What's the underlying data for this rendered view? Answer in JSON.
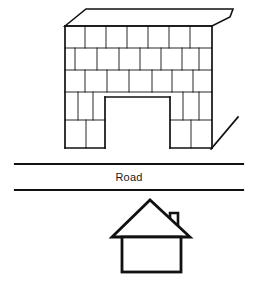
{
  "diagram": {
    "labels": {
      "road": "Road"
    },
    "colors": {
      "stroke": "#111111",
      "background": "#ffffff",
      "text": "#1a1a1a"
    },
    "elements": {
      "retaining_wall": {
        "name": "brick retaining wall with arch opening",
        "wall_left_x": 65,
        "wall_right_x": 212,
        "wall_top_y": 26,
        "wall_bottom_y": 148,
        "course_lines_y": [
          26,
          48,
          70,
          92,
          120,
          148
        ],
        "opening": {
          "left_x": 105,
          "right_x": 170,
          "top_y": 97,
          "bottom_y": 148
        },
        "roof_slab": {
          "front_left": [
            65,
            26
          ],
          "front_right": [
            212,
            26
          ],
          "back_left": [
            86,
            9
          ],
          "back_right": [
            233,
            9
          ],
          "right_corner_drop": [
            230,
            17
          ]
        },
        "courses": 5,
        "joint_pattern": "staggered running bond"
      },
      "diagonal_marker": {
        "name": "slope indicator line",
        "x1": 211,
        "y1": 149,
        "x2": 238,
        "y2": 117
      },
      "road_band": {
        "name": "road between two lines",
        "left_x": 15,
        "right_x": 243,
        "top_line_y": 164,
        "bottom_line_y": 190,
        "label_x": 129,
        "label_y": 177
      },
      "house": {
        "name": "small house below road",
        "roof_apex": [
          150,
          200
        ],
        "roof_left_eave": [
          112,
          237
        ],
        "roof_right_eave": [
          190,
          237
        ],
        "body_left_x": 122,
        "body_right_x": 181,
        "body_top_y": 237,
        "body_bottom_y": 272,
        "chimney": {
          "left_x": 170,
          "right_x": 178,
          "top_y": 212,
          "bottom_y": 232
        }
      }
    }
  }
}
